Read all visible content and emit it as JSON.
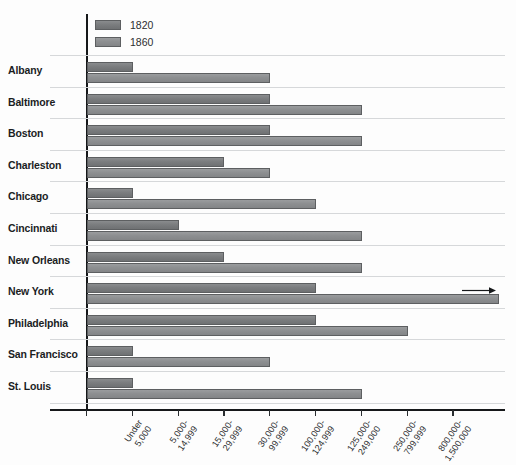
{
  "chart_data": {
    "type": "bar",
    "orientation": "horizontal",
    "title": "",
    "xlabel": "",
    "ylabel": "",
    "grid": true,
    "legend_position": "top-left",
    "categories": [
      "Albany",
      "Baltimore",
      "Boston",
      "Charleston",
      "Chicago",
      "Cincinnati",
      "New Orleans",
      "New York",
      "Philadelphia",
      "San Francisco",
      "St. Louis"
    ],
    "x_tick_labels": [
      "Under 5,000",
      "5,000-14,999",
      "15,000-29,999",
      "30,000-99,999",
      "100,000-124,999",
      "125,000-249,000",
      "250,000-799,999",
      "800,000-1,500,000"
    ],
    "x_tick_lines": [
      [
        "Under",
        "5,000"
      ],
      [
        "5,000-",
        "14,999"
      ],
      [
        "15,000-",
        "29,999"
      ],
      [
        "30,000-",
        "99,999"
      ],
      [
        "100,000-",
        "124,999"
      ],
      [
        "125,000-",
        "249,000"
      ],
      [
        "250,000-",
        "799,999"
      ],
      [
        "800,000-",
        "1,500,000"
      ]
    ],
    "series": [
      {
        "name": "1820",
        "color": "#7b7d7f",
        "values": [
          1,
          4,
          4,
          3,
          1,
          2,
          3,
          5,
          5,
          1,
          1
        ]
      },
      {
        "name": "1860",
        "color": "#8d8f91",
        "values": [
          4,
          6,
          6,
          4,
          5,
          6,
          6,
          9,
          7,
          4,
          6
        ]
      }
    ],
    "value_meaning": "Bar length encodes the population-size bin the city fell into; bin index 1 = 'Under 5,000' through bin index 8 = '800,000-1,500,000'.",
    "annotations": [
      {
        "series": "1860",
        "category": "New York",
        "icon": "right-arrow",
        "note": "bar extends beyond last category"
      }
    ]
  },
  "legend": {
    "items": [
      {
        "label": "1820"
      },
      {
        "label": "1860"
      }
    ]
  }
}
